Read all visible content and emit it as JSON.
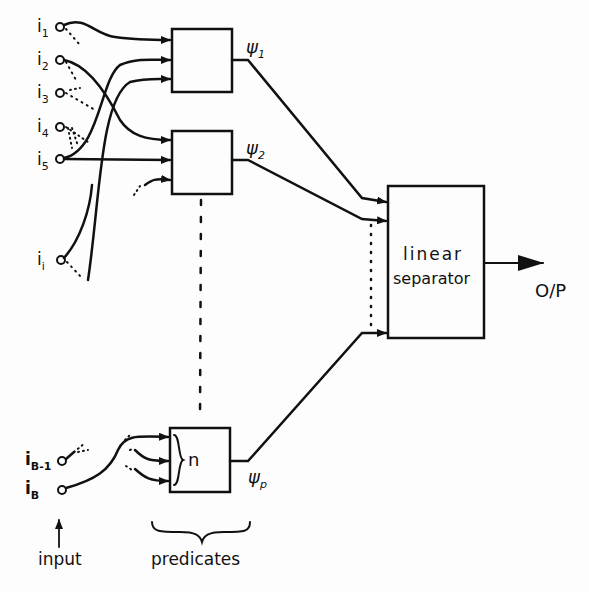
{
  "inputs": [
    {
      "name": "i",
      "sub": "1"
    },
    {
      "name": "i",
      "sub": "2"
    },
    {
      "name": "i",
      "sub": "3"
    },
    {
      "name": "i",
      "sub": "4"
    },
    {
      "name": "i",
      "sub": "5"
    },
    {
      "name": "i",
      "sub": "i"
    },
    {
      "name": "i",
      "sub": "B-1"
    },
    {
      "name": "i",
      "sub": "B"
    }
  ],
  "predicates": [
    {
      "symbol": "ψ",
      "sub": "1"
    },
    {
      "symbol": "ψ",
      "sub": "2"
    },
    {
      "symbol": "ψ",
      "sub": "p"
    }
  ],
  "predicate_fan_in_label": "n",
  "separator": {
    "line1": "linear",
    "line2": "separator"
  },
  "output_label": "O/P",
  "footer": {
    "input_label": "input",
    "predicates_label": "predicates"
  },
  "colors": {
    "ink": "#111111",
    "background": "#fdfdfd"
  }
}
